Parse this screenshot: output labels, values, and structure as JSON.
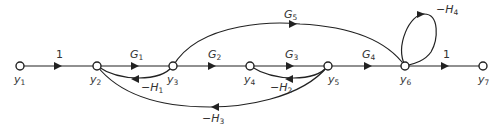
{
  "diagram": {
    "type": "signal-flow-graph",
    "nodes": [
      {
        "id": "y1",
        "label": "y",
        "sub": "1"
      },
      {
        "id": "y2",
        "label": "y",
        "sub": "2"
      },
      {
        "id": "y3",
        "label": "y",
        "sub": "3"
      },
      {
        "id": "y4",
        "label": "y",
        "sub": "4"
      },
      {
        "id": "y5",
        "label": "y",
        "sub": "5"
      },
      {
        "id": "y6",
        "label": "y",
        "sub": "6"
      },
      {
        "id": "y7",
        "label": "y",
        "sub": "7"
      }
    ],
    "edges": [
      {
        "from": "y1",
        "to": "y2",
        "gain": "1",
        "gain_sub": ""
      },
      {
        "from": "y2",
        "to": "y3",
        "gain": "G",
        "gain_sub": "1"
      },
      {
        "from": "y3",
        "to": "y2",
        "gain": "−H",
        "gain_sub": "1"
      },
      {
        "from": "y3",
        "to": "y4",
        "gain": "G",
        "gain_sub": "2"
      },
      {
        "from": "y4",
        "to": "y5",
        "gain": "G",
        "gain_sub": "3"
      },
      {
        "from": "y5",
        "to": "y4",
        "gain": "−H",
        "gain_sub": "2"
      },
      {
        "from": "y5",
        "to": "y6",
        "gain": "G",
        "gain_sub": "4"
      },
      {
        "from": "y3",
        "to": "y6",
        "gain": "G",
        "gain_sub": "5"
      },
      {
        "from": "y6",
        "to": "y6",
        "gain": "−H",
        "gain_sub": "4"
      },
      {
        "from": "y5",
        "to": "y2",
        "gain": "−H",
        "gain_sub": "3"
      },
      {
        "from": "y6",
        "to": "y7",
        "gain": "1",
        "gain_sub": ""
      }
    ]
  }
}
